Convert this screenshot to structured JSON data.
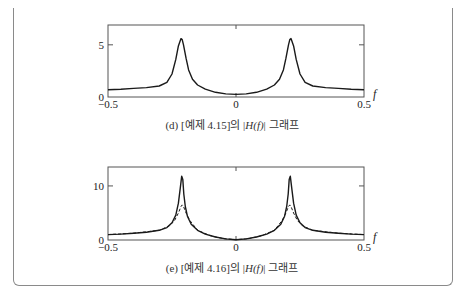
{
  "chart_data": [
    {
      "type": "line",
      "id": "d",
      "caption": "(d) [예제 4.15]의 |H(f)| 그래프",
      "caption_parts": {
        "prefix": "(d) [예제 4.15]의 |",
        "func": "H(f)",
        "suffix": "| 그래프"
      },
      "xlabel": "f",
      "ylabel": "",
      "xlim": [
        -0.5,
        0.5
      ],
      "ylim": [
        0,
        6.9
      ],
      "x_ticks": [
        -0.5,
        0,
        0.5
      ],
      "x_tick_labels": [
        "−0.5",
        "0",
        "0.5"
      ],
      "y_ticks": [
        0,
        5
      ],
      "y_tick_labels": [
        "0",
        "5"
      ],
      "grid": false,
      "legend": null,
      "series": [
        {
          "name": "|H(f)|",
          "style": "solid",
          "x": [
            -0.5,
            -0.45,
            -0.4,
            -0.35,
            -0.3,
            -0.27,
            -0.25,
            -0.235,
            -0.225,
            -0.215,
            -0.21,
            -0.205,
            -0.195,
            -0.185,
            -0.17,
            -0.15,
            -0.12,
            -0.08,
            -0.04,
            0,
            0.04,
            0.08,
            0.12,
            0.15,
            0.17,
            0.185,
            0.195,
            0.205,
            0.21,
            0.215,
            0.225,
            0.235,
            0.25,
            0.27,
            0.3,
            0.35,
            0.4,
            0.45,
            0.5
          ],
          "y": [
            0.7,
            0.75,
            0.82,
            0.9,
            1.05,
            1.4,
            2.2,
            3.6,
            4.9,
            5.6,
            5.5,
            5.0,
            3.7,
            2.6,
            1.7,
            1.15,
            0.75,
            0.45,
            0.3,
            0.25,
            0.3,
            0.45,
            0.75,
            1.15,
            1.7,
            2.6,
            3.7,
            5.0,
            5.5,
            5.6,
            4.9,
            3.6,
            2.2,
            1.4,
            1.05,
            0.9,
            0.82,
            0.75,
            0.7
          ]
        }
      ]
    },
    {
      "type": "line",
      "id": "e",
      "caption": "(e) [예제 4.16]의 |H(f)| 그래프",
      "caption_parts": {
        "prefix": "(e) [예제 4.16]의 |",
        "func": "H(f)",
        "suffix": "| 그래프"
      },
      "xlabel": "f",
      "ylabel": "",
      "xlim": [
        -0.5,
        0.5
      ],
      "ylim": [
        0,
        13.5
      ],
      "x_ticks": [
        -0.5,
        0,
        0.5
      ],
      "x_tick_labels": [
        "−0.5",
        "0",
        "0.5"
      ],
      "y_ticks": [
        0,
        10
      ],
      "y_tick_labels": [
        "0",
        "10"
      ],
      "grid": false,
      "legend": null,
      "series": [
        {
          "name": "|H(f)| (solid)",
          "style": "solid",
          "x": [
            -0.5,
            -0.45,
            -0.4,
            -0.35,
            -0.3,
            -0.27,
            -0.25,
            -0.235,
            -0.225,
            -0.218,
            -0.212,
            -0.208,
            -0.204,
            -0.198,
            -0.19,
            -0.175,
            -0.15,
            -0.12,
            -0.08,
            -0.04,
            0,
            0.04,
            0.08,
            0.12,
            0.15,
            0.175,
            0.19,
            0.198,
            0.204,
            0.208,
            0.212,
            0.218,
            0.225,
            0.235,
            0.25,
            0.27,
            0.3,
            0.35,
            0.4,
            0.45,
            0.5
          ],
          "y": [
            1.0,
            1.1,
            1.25,
            1.45,
            1.8,
            2.3,
            3.2,
            4.6,
            6.8,
            9.5,
            11.8,
            11.2,
            8.5,
            6.2,
            4.4,
            2.9,
            1.8,
            1.1,
            0.55,
            0.2,
            0.05,
            0.2,
            0.55,
            1.1,
            1.8,
            2.9,
            4.4,
            6.2,
            8.5,
            11.2,
            11.8,
            9.5,
            6.8,
            4.6,
            3.2,
            2.3,
            1.8,
            1.45,
            1.25,
            1.1,
            1.0
          ]
        },
        {
          "name": "|H(f)| (dashed)",
          "style": "dashed",
          "x": [
            -0.5,
            -0.4,
            -0.3,
            -0.26,
            -0.24,
            -0.225,
            -0.215,
            -0.21,
            -0.205,
            -0.195,
            -0.18,
            -0.15,
            -0.1,
            -0.05,
            0,
            0.05,
            0.1,
            0.15,
            0.18,
            0.195,
            0.205,
            0.21,
            0.215,
            0.225,
            0.24,
            0.26,
            0.3,
            0.4,
            0.5
          ],
          "y": [
            1.0,
            1.25,
            1.8,
            2.6,
            3.6,
            5.0,
            6.2,
            6.5,
            6.2,
            5.0,
            3.6,
            1.8,
            0.8,
            0.25,
            0.05,
            0.25,
            0.8,
            1.8,
            3.6,
            5.0,
            6.2,
            6.5,
            6.2,
            5.0,
            3.6,
            2.6,
            1.8,
            1.25,
            1.0
          ]
        }
      ]
    }
  ],
  "layout_frames": {
    "d": {
      "left": 108,
      "right": 364,
      "top": 25,
      "bottom": 97,
      "caption_top": 116
    },
    "e": {
      "left": 108,
      "right": 364,
      "top": 167,
      "bottom": 240,
      "caption_top": 259
    }
  }
}
